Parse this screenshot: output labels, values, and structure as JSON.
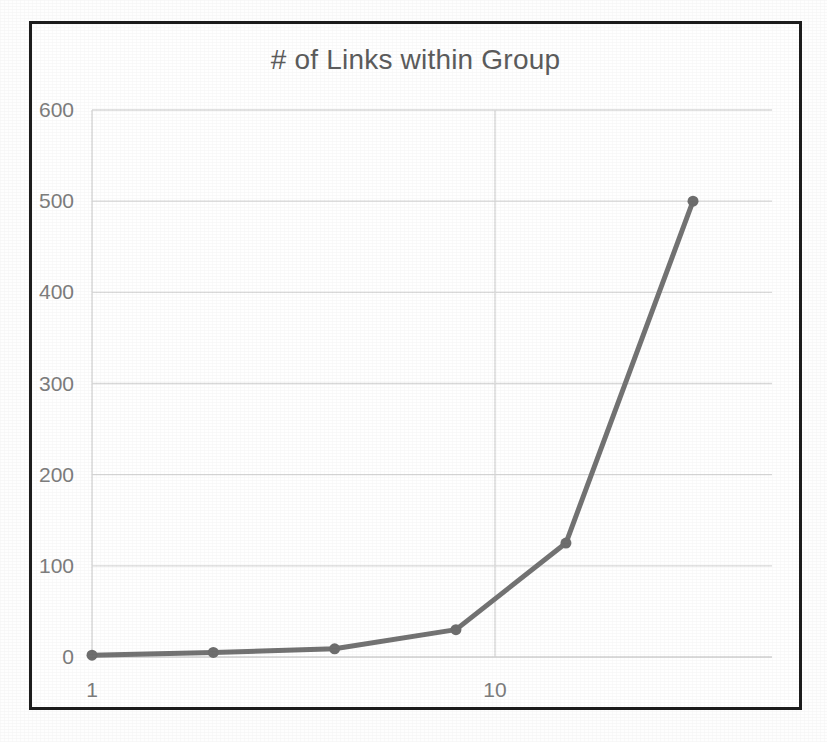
{
  "chart_data": {
    "type": "line",
    "title": "# of Links within Group",
    "xlabel": "",
    "ylabel": "",
    "xscale": "log",
    "yscale": "linear",
    "xlim": [
      1,
      40
    ],
    "ylim": [
      0,
      600
    ],
    "x_tick_labels": [
      "1",
      "10"
    ],
    "x_ticks": [
      1,
      10
    ],
    "y_tick_labels": [
      "0",
      "100",
      "200",
      "300",
      "400",
      "500",
      "600"
    ],
    "y_ticks": [
      0,
      100,
      200,
      300,
      400,
      500,
      600
    ],
    "grid": "horizontal-and-x-major",
    "legend": "none",
    "series": [
      {
        "name": "# of Links within Group",
        "color": "#737373",
        "marker": "circle",
        "x": [
          1,
          2,
          4,
          8,
          15,
          31
        ],
        "values": [
          2,
          5,
          9,
          30,
          125,
          500
        ],
        "points": [
          {
            "x": 1,
            "y": 2
          },
          {
            "x": 2,
            "y": 5
          },
          {
            "x": 4,
            "y": 9
          },
          {
            "x": 8,
            "y": 30
          },
          {
            "x": 15,
            "y": 125
          },
          {
            "x": 31,
            "y": 500
          }
        ]
      }
    ]
  },
  "style": {
    "line_color": "#737373",
    "marker_color": "#6e6e6e",
    "grid_color": "#d9d9d9",
    "axis_color": "#d0d0d0",
    "tick_text_color": "#7d7d7d",
    "title_color": "#5c5c5c",
    "frame_color": "#1d1d1d",
    "background": "#ffffff"
  }
}
